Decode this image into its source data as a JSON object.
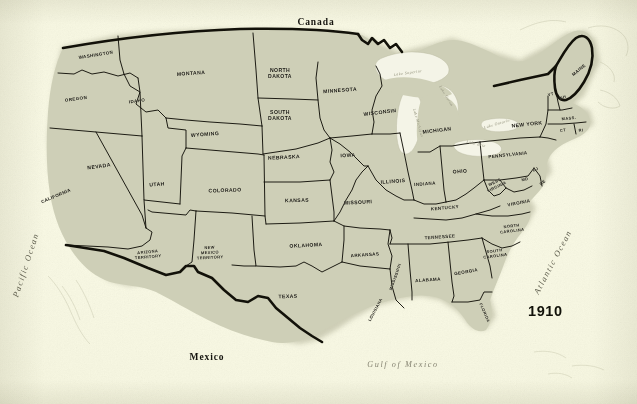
{
  "figure": {
    "year": "1910",
    "countries": [
      {
        "name": "Canada",
        "x": 316,
        "y": 22
      },
      {
        "name": "Mexico",
        "x": 207,
        "y": 357
      }
    ],
    "oceans": [
      {
        "name": "Pacific Ocean",
        "x": 26,
        "y": 265,
        "rotate": -72
      },
      {
        "name": "Atlantic Ocean",
        "x": 553,
        "y": 262,
        "rotate": -62
      },
      {
        "name": "Gulf of Mexico",
        "x": 403,
        "y": 364,
        "rotate": 0
      }
    ],
    "lakes": [
      {
        "name": "Lake Superior",
        "x": 408,
        "y": 73,
        "rotate": -8
      },
      {
        "name": "Lake Michigan",
        "x": 418,
        "y": 123,
        "rotate": 74
      },
      {
        "name": "Lake Huron",
        "x": 446,
        "y": 96,
        "rotate": 58
      },
      {
        "name": "Lake Erie",
        "x": 476,
        "y": 144,
        "rotate": 14
      },
      {
        "name": "Lake Ontario",
        "x": 497,
        "y": 124,
        "rotate": -16
      }
    ],
    "states": [
      {
        "name": "WASHINGTON",
        "x": 96,
        "y": 55,
        "rotate": -9,
        "size": "sm"
      },
      {
        "name": "OREGON",
        "x": 76,
        "y": 99,
        "rotate": -7,
        "size": "sm"
      },
      {
        "name": "IDAHO",
        "x": 137,
        "y": 101,
        "rotate": -8,
        "size": "sm"
      },
      {
        "name": "MONTANA",
        "x": 191,
        "y": 73,
        "rotate": -4,
        "size": ""
      },
      {
        "name": "NORTH\nDAKOTA",
        "x": 280,
        "y": 73,
        "rotate": 0,
        "size": ""
      },
      {
        "name": "SOUTH\nDAKOTA",
        "x": 280,
        "y": 115,
        "rotate": 0,
        "size": ""
      },
      {
        "name": "WYOMING",
        "x": 205,
        "y": 134,
        "rotate": -4,
        "size": ""
      },
      {
        "name": "NEVADA",
        "x": 99,
        "y": 166,
        "rotate": -8,
        "size": ""
      },
      {
        "name": "UTAH",
        "x": 157,
        "y": 184,
        "rotate": -5,
        "size": ""
      },
      {
        "name": "CALIFORNIA",
        "x": 56,
        "y": 196,
        "rotate": -23,
        "size": "sm"
      },
      {
        "name": "COLORADO",
        "x": 225,
        "y": 190,
        "rotate": -2,
        "size": ""
      },
      {
        "name": "NEBRASKA",
        "x": 284,
        "y": 157,
        "rotate": -3,
        "size": ""
      },
      {
        "name": "KANSAS",
        "x": 297,
        "y": 200,
        "rotate": -2,
        "size": ""
      },
      {
        "name": "IOWA",
        "x": 348,
        "y": 155,
        "rotate": -3,
        "size": ""
      },
      {
        "name": "MINNESOTA",
        "x": 340,
        "y": 90,
        "rotate": -4,
        "size": ""
      },
      {
        "name": "WISCONSIN",
        "x": 380,
        "y": 112,
        "rotate": -7,
        "size": ""
      },
      {
        "name": "MICHIGAN",
        "x": 437,
        "y": 130,
        "rotate": -7,
        "size": ""
      },
      {
        "name": "MISSOURI",
        "x": 358,
        "y": 202,
        "rotate": -3,
        "size": ""
      },
      {
        "name": "ILLINOIS",
        "x": 393,
        "y": 181,
        "rotate": -4,
        "size": ""
      },
      {
        "name": "INDIANA",
        "x": 425,
        "y": 184,
        "rotate": -4,
        "size": "sm"
      },
      {
        "name": "OHIO",
        "x": 460,
        "y": 171,
        "rotate": -4,
        "size": ""
      },
      {
        "name": "PENNSYLVANIA",
        "x": 508,
        "y": 155,
        "rotate": -6,
        "size": "sm"
      },
      {
        "name": "NEW YORK",
        "x": 527,
        "y": 124,
        "rotate": -6,
        "size": ""
      },
      {
        "name": "MAINE",
        "x": 579,
        "y": 70,
        "rotate": -40,
        "size": "sm"
      },
      {
        "name": "VT",
        "x": 551,
        "y": 95,
        "rotate": -14,
        "size": "xs"
      },
      {
        "name": "NH",
        "x": 563,
        "y": 98,
        "rotate": -14,
        "size": "xs"
      },
      {
        "name": "MASS.",
        "x": 569,
        "y": 119,
        "rotate": -6,
        "size": "xs"
      },
      {
        "name": "CT",
        "x": 563,
        "y": 131,
        "rotate": -6,
        "size": "xs"
      },
      {
        "name": "RI",
        "x": 581,
        "y": 131,
        "rotate": -6,
        "size": "xs"
      },
      {
        "name": "NJ",
        "x": 536,
        "y": 170,
        "rotate": -28,
        "size": "xs"
      },
      {
        "name": "MD",
        "x": 525,
        "y": 180,
        "rotate": -10,
        "size": "xs"
      },
      {
        "name": "DE",
        "x": 543,
        "y": 183,
        "rotate": -40,
        "size": "xs"
      },
      {
        "name": "WEST\nVIRGINIA",
        "x": 496,
        "y": 185,
        "rotate": -26,
        "size": "xs"
      },
      {
        "name": "VIRGINIA",
        "x": 519,
        "y": 203,
        "rotate": -11,
        "size": "sm"
      },
      {
        "name": "KENTUCKY",
        "x": 445,
        "y": 208,
        "rotate": -5,
        "size": "sm"
      },
      {
        "name": "TENNESSEE",
        "x": 440,
        "y": 237,
        "rotate": -4,
        "size": "sm"
      },
      {
        "name": "NORTH\nCAROLINA",
        "x": 512,
        "y": 229,
        "rotate": -7,
        "size": "xs"
      },
      {
        "name": "SOUTH\nCAROLINA",
        "x": 495,
        "y": 254,
        "rotate": -8,
        "size": "xs"
      },
      {
        "name": "GEORGIA",
        "x": 466,
        "y": 272,
        "rotate": -10,
        "size": "sm"
      },
      {
        "name": "ALABAMA",
        "x": 428,
        "y": 280,
        "rotate": -4,
        "size": "sm"
      },
      {
        "name": "MISSISSIPPI",
        "x": 396,
        "y": 277,
        "rotate": -70,
        "size": "xs"
      },
      {
        "name": "ARKANSAS",
        "x": 365,
        "y": 255,
        "rotate": -4,
        "size": "sm"
      },
      {
        "name": "LOUISIANA",
        "x": 376,
        "y": 310,
        "rotate": -62,
        "size": "xs"
      },
      {
        "name": "FLORIDA",
        "x": 484,
        "y": 313,
        "rotate": 66,
        "size": "xs"
      },
      {
        "name": "OKLAHOMA",
        "x": 306,
        "y": 245,
        "rotate": -3,
        "size": ""
      },
      {
        "name": "TEXAS",
        "x": 288,
        "y": 296,
        "rotate": -2,
        "size": ""
      },
      {
        "name": "NEW\nMEXICO\nTERRITORY",
        "x": 210,
        "y": 253,
        "rotate": -3,
        "size": "xs"
      },
      {
        "name": "ARIZONA\nTERRITORY",
        "x": 148,
        "y": 255,
        "rotate": -5,
        "size": "xs"
      }
    ],
    "colors": {
      "paper": "#f8f8e6",
      "land": "#cfcfb8",
      "ink": "#15140f",
      "water": "#f4f4e8",
      "ocean_text": "#5d5c4c"
    }
  }
}
